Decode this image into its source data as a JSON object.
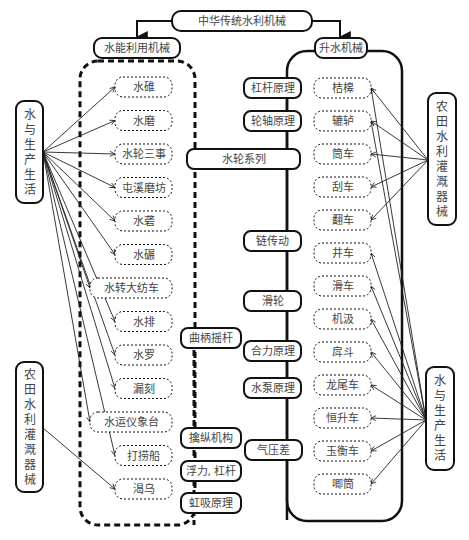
{
  "title": "中华传统水利机械",
  "categories": {
    "left": "水能利用机械",
    "right": "升水机械"
  },
  "left_items": [
    "水碓",
    "水磨",
    "水轮三事",
    "屯溪磨坊",
    "水砻",
    "水碾",
    "水转大纺车",
    "水排",
    "水罗",
    "漏刻",
    "水运仪象台",
    "打捞船",
    "渴乌"
  ],
  "right_items": [
    "桔槔",
    "辘轳",
    "筒车",
    "刮车",
    "翻车",
    "井车",
    "滑车",
    "机汲",
    "戽斗",
    "龙尾车",
    "恒升车",
    "玉衡车",
    "唧筒"
  ],
  "principles_left": [
    "曲柄摇杆",
    "擒纵机构",
    "浮力, 杠杆",
    "虹吸原理"
  ],
  "principles_right": [
    "杠杆原理",
    "轮轴原理",
    "水轮系列",
    "链传动",
    "滑轮",
    "合力原理",
    "水泵原理",
    "气压差"
  ],
  "side_groups": {
    "left_top": "水与生产生活",
    "left_bottom": "农田水利灌溉器械",
    "right_top": "农田水利灌溉器械",
    "right_bottom": "水与生产生活"
  },
  "links": {
    "left_top_targets": [
      "水碓",
      "水磨",
      "水轮三事",
      "屯溪磨坊",
      "水砻",
      "水碾",
      "水转大纺车",
      "水排",
      "水罗",
      "漏刻",
      "水运仪象台",
      "打捞船"
    ],
    "left_bottom_targets": [
      "渴乌"
    ],
    "right_top_targets": [
      "桔槔",
      "辘轳",
      "筒车",
      "刮车",
      "翻车"
    ],
    "right_bottom_targets": [
      "桔槔",
      "辘轳",
      "井车",
      "滑车",
      "机汲",
      "戽斗",
      "龙尾车",
      "恒升车",
      "玉衡车",
      "唧筒"
    ]
  }
}
